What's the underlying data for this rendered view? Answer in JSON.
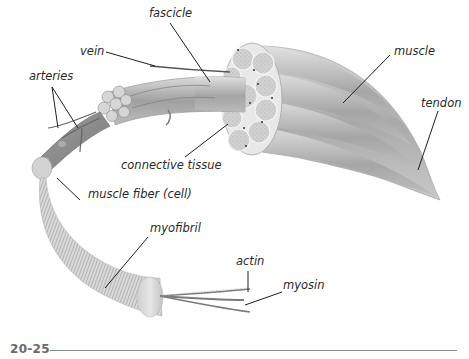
{
  "figure": {
    "number": "20-25",
    "type": "anatomical illustration"
  },
  "labels": {
    "fascicle": "fascicle",
    "vein": "vein",
    "arteries": "arteries",
    "muscle": "muscle",
    "tendon": "tendon",
    "connective_tissue": "connective tissue",
    "muscle_fiber": "muscle fiber (cell)",
    "myofibril": "myofibril",
    "actin": "actin",
    "myosin": "myosin"
  },
  "colors": {
    "label_text": "#2a2a2a",
    "leader_line": "#1e1e1e",
    "muscle_fill": "#b8b8b8",
    "fiber_fill": "#8f8f8f",
    "figure_number": "#6a6a6a",
    "rule": "#8a8a8a"
  }
}
